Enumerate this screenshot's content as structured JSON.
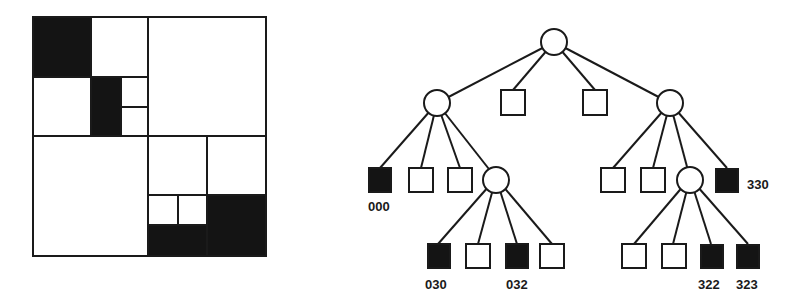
{
  "colors": {
    "ink": "#1a1a1a",
    "fill_black": "#141414",
    "background": "#ffffff"
  },
  "quadtree_grid": {
    "description": "Region quadtree decomposition of a square image",
    "black_regions": [
      "00",
      "030",
      "032",
      "322",
      "323",
      "33"
    ]
  },
  "tree": {
    "root": {
      "type": "internal-node"
    },
    "level1": [
      {
        "id": "0",
        "type": "internal-node"
      },
      {
        "id": "1",
        "type": "white-leaf"
      },
      {
        "id": "2",
        "type": "white-leaf"
      },
      {
        "id": "3",
        "type": "internal-node"
      }
    ],
    "labels": {
      "l000": "000",
      "l030": "030",
      "l032": "032",
      "l322": "322",
      "l323": "323",
      "l330": "330"
    }
  }
}
